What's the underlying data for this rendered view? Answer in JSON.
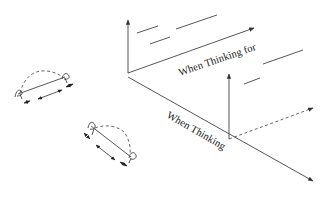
{
  "diagram": {
    "type": "isometric-axes-sketch",
    "labels": {
      "back_axis": "When Thinking for",
      "front_axis": "When Thinking"
    },
    "colors": {
      "line": "#444444",
      "text": "#222222",
      "background": "#ffffff"
    },
    "elements": [
      {
        "name": "back-vertical-axis",
        "style": "solid-arrow"
      },
      {
        "name": "back-horizontal-axis",
        "style": "solid-arrow"
      },
      {
        "name": "front-diagonal-axis",
        "style": "solid-arrow"
      },
      {
        "name": "front-vertical-axis",
        "style": "solid-arrow"
      },
      {
        "name": "front-dashed-axis",
        "style": "dashed-arrow"
      },
      {
        "name": "left-dipole-figure-1",
        "style": "arc-with-arrows"
      },
      {
        "name": "left-dipole-figure-2",
        "style": "arc-with-arrows"
      }
    ]
  }
}
